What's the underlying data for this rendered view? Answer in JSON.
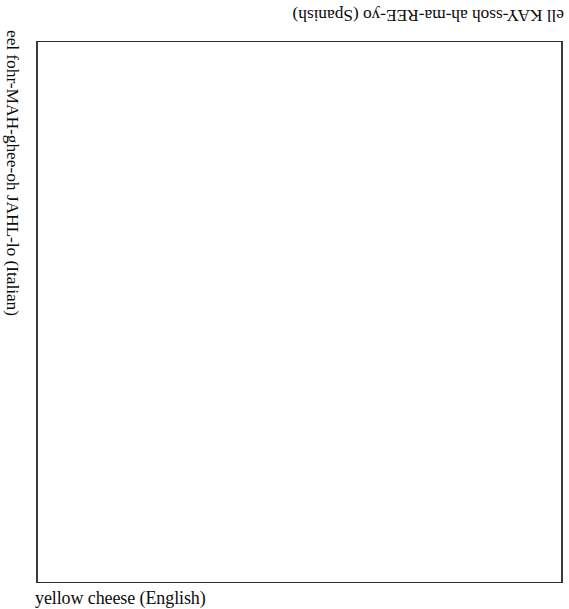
{
  "page": {
    "background_color": "#ffffff",
    "ink_color": "#0d0d0d",
    "border_color": "#3a3a3a"
  },
  "answer_box": {
    "name": "empty-illustration-box",
    "content": ""
  },
  "captions": {
    "spanish": {
      "text": "ell KAY-ssoh ah-ma-REE-yo (Spanish)",
      "language": "Spanish",
      "orientation": "rotated-180"
    },
    "italian": {
      "text": "eel fohr-MAH-ghee-oh JAHL-lo (Italian)",
      "language": "Italian",
      "orientation": "rotated-90-clockwise"
    },
    "english": {
      "text": "yellow cheese (English)",
      "language": "English",
      "orientation": "upright"
    }
  }
}
